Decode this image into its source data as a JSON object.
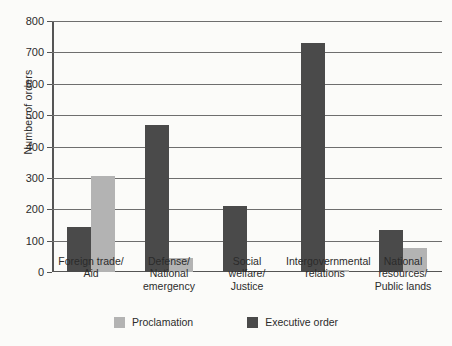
{
  "chart_data": {
    "type": "bar",
    "title": "",
    "xlabel": "",
    "ylabel": "Number of orders",
    "ylim": [
      0,
      800
    ],
    "ytick_step": 100,
    "yticks": [
      0,
      100,
      200,
      300,
      400,
      500,
      600,
      700,
      800
    ],
    "grid": "horizontal",
    "legend_position": "bottom-center",
    "categories": [
      "Foreign trade/\nAid",
      "Defense/\nNational\nemergency",
      "Social\nwelfare/\nJustice",
      "Intergovernmental\nrelations",
      "National\nresources/\nPublic lands"
    ],
    "series": [
      {
        "name": "Executive order",
        "color": "#4a4a4a",
        "values": [
          145,
          470,
          210,
          730,
          135
        ]
      },
      {
        "name": "Proclamation",
        "color": "#b3b3b3",
        "values": [
          305,
          45,
          0,
          8,
          75
        ]
      }
    ]
  },
  "legend": {
    "items": [
      {
        "label": "Proclamation",
        "swatch": "proc"
      },
      {
        "label": "Executive order",
        "swatch": "eo"
      }
    ]
  }
}
